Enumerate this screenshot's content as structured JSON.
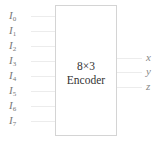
{
  "diagram": {
    "block": {
      "line1": "8×3",
      "line2": "Encoder"
    },
    "inputs": [
      {
        "base": "I",
        "sub": "0"
      },
      {
        "base": "I",
        "sub": "1"
      },
      {
        "base": "I",
        "sub": "2"
      },
      {
        "base": "I",
        "sub": "3"
      },
      {
        "base": "I",
        "sub": "4"
      },
      {
        "base": "I",
        "sub": "5"
      },
      {
        "base": "I",
        "sub": "6"
      },
      {
        "base": "I",
        "sub": "7"
      }
    ],
    "outputs": [
      "x",
      "y",
      "z"
    ],
    "colors": {
      "border": "#d4d4d4",
      "text": "#333333",
      "label": "#777777"
    }
  }
}
